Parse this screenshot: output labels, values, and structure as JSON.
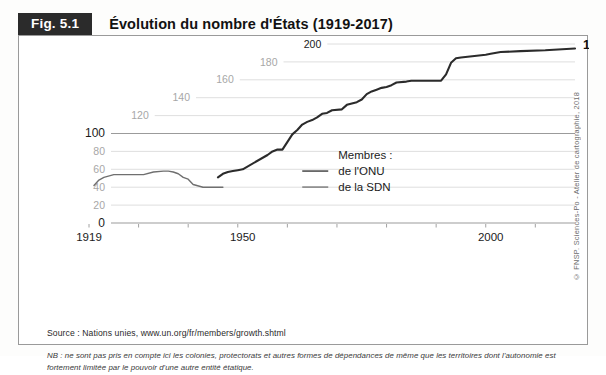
{
  "figure": {
    "tag": "Fig. 5.1",
    "title": "Évolution du nombre d'États (1919-2017)",
    "credit": "© FNSP. Sciences-Po - Atelier de cartographie, 2018",
    "source": "Source : Nations unies, www.un.org/fr/members/growth.shtml",
    "note": "NB : ne sont pas pris en compte ici les colonies, protectorats et autres formes de dépendances de même que les territoires dont l'autonomie est fortement limitée par le pouvoir d'une autre entité étatique.",
    "end_value_label": "195"
  },
  "legend": {
    "title": "Membres :",
    "items": [
      {
        "label": "de l'ONU",
        "color": "#2b2b2b"
      },
      {
        "label": "de la SDN",
        "color": "#6f6f6f"
      }
    ]
  },
  "chart_data": {
    "type": "line",
    "title": "Évolution du nombre d'États (1919-2017)",
    "xlabel": "",
    "ylabel": "",
    "xlim": [
      1919,
      2017
    ],
    "ylim": [
      0,
      200
    ],
    "grid": true,
    "legend_position": "center-right",
    "xticks": [
      1919,
      1929,
      1939,
      1949,
      1959,
      1969,
      1979,
      1989,
      1999,
      2009
    ],
    "xtick_labels": [
      {
        "x": 1919,
        "label": "1919"
      },
      {
        "x": 1950,
        "label": "1950"
      },
      {
        "x": 2000,
        "label": "2000"
      }
    ],
    "yticks": [
      0,
      20,
      40,
      60,
      80,
      100,
      120,
      140,
      160,
      180,
      200
    ],
    "ytick_labels": [
      "0",
      "20",
      "40",
      "60",
      "80",
      "100",
      "120",
      "140",
      "160",
      "180",
      "200"
    ],
    "series": [
      {
        "name": "de l'ONU",
        "color": "#2b2b2b",
        "x": [
          1945,
          1946,
          1947,
          1948,
          1949,
          1950,
          1955,
          1956,
          1957,
          1958,
          1960,
          1961,
          1962,
          1963,
          1964,
          1965,
          1966,
          1967,
          1968,
          1970,
          1971,
          1973,
          1974,
          1975,
          1976,
          1977,
          1978,
          1979,
          1980,
          1981,
          1983,
          1984,
          1990,
          1991,
          1992,
          1993,
          1994,
          1999,
          2000,
          2002,
          2006,
          2011,
          2017
        ],
        "values": [
          51,
          55,
          57,
          58,
          59,
          60,
          76,
          80,
          82,
          82,
          99,
          104,
          110,
          113,
          115,
          118,
          122,
          123,
          126,
          127,
          132,
          135,
          138,
          144,
          147,
          149,
          151,
          152,
          154,
          157,
          158,
          159,
          159,
          166,
          179,
          184,
          185,
          188,
          189,
          191,
          192,
          193,
          195
        ]
      },
      {
        "name": "de la SDN",
        "color": "#6f6f6f",
        "x": [
          1920,
          1921,
          1922,
          1924,
          1926,
          1928,
          1930,
          1932,
          1934,
          1935,
          1936,
          1937,
          1938,
          1939,
          1940,
          1942,
          1946
        ],
        "values": [
          42,
          48,
          51,
          54,
          54,
          54,
          54,
          57,
          58,
          58,
          57,
          55,
          51,
          49,
          43,
          40,
          40
        ]
      }
    ],
    "annotations": [
      {
        "text": "195",
        "x": 2017,
        "y": 200,
        "bold": true
      }
    ]
  }
}
